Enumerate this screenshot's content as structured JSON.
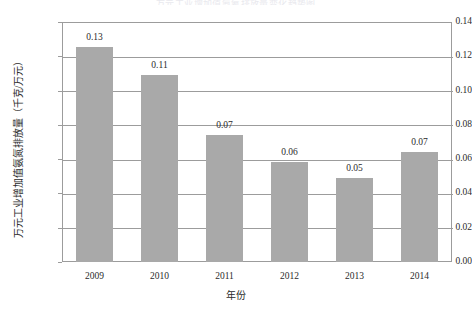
{
  "figure": {
    "title_fragment": "万元工业增加值氨氮排放量变化趋势图"
  },
  "chart_data": {
    "type": "bar",
    "title": "",
    "categories": [
      "2009",
      "2010",
      "2011",
      "2012",
      "2013",
      "2014"
    ],
    "values": [
      0.13,
      0.11,
      0.07,
      0.06,
      0.05,
      0.07
    ],
    "data_labels": [
      "0.13",
      "0.11",
      "0.07",
      "0.06",
      "0.05",
      "0.07"
    ],
    "xlabel": "年份",
    "ylabel": "万元工业增加值氨氮排放量（千克/万元）",
    "ylim": [
      0.0,
      0.14
    ],
    "ytick_labels": [
      "0.00",
      "0.02",
      "0.04",
      "0.06",
      "0.08",
      "0.10",
      "0.12",
      "0.14"
    ],
    "ytick_values": [
      0.0,
      0.02,
      0.04,
      0.06,
      0.08,
      0.1,
      0.12,
      0.14
    ],
    "grid": true,
    "grid_axis": "y",
    "legend": null,
    "series_color": "#a9a9a9",
    "axis_color": "#9c9c9c",
    "bar_exact_heights": [
      0.1255,
      0.1092,
      0.0742,
      0.0585,
      0.0492,
      0.064
    ]
  }
}
